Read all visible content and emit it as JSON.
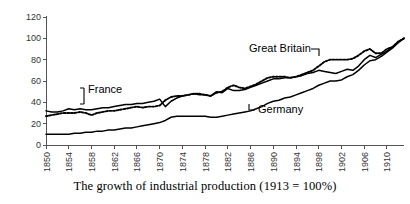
{
  "caption": "The growth of industrial production (1913 = 100%)",
  "annotations": [
    {
      "id": "france",
      "label": "France"
    },
    {
      "id": "britain",
      "label": "Great Britain"
    },
    {
      "id": "germany",
      "label": "Germany"
    }
  ],
  "chart_data": {
    "type": "line",
    "title": "The growth of industrial production (1913 = 100%)",
    "xlabel": "",
    "ylabel": "",
    "xlim": [
      1850,
      1913
    ],
    "ylim": [
      0,
      120
    ],
    "grid": false,
    "legend_position": "inline-annotations",
    "yticks": [
      0,
      20,
      40,
      60,
      80,
      100,
      120
    ],
    "xticks": [
      1850,
      1854,
      1858,
      1862,
      1866,
      1870,
      1874,
      1878,
      1882,
      1886,
      1890,
      1894,
      1898,
      1902,
      1906,
      1910
    ],
    "x": [
      1850,
      1851,
      1852,
      1853,
      1854,
      1855,
      1856,
      1857,
      1858,
      1859,
      1860,
      1861,
      1862,
      1863,
      1864,
      1865,
      1866,
      1867,
      1868,
      1869,
      1870,
      1871,
      1872,
      1873,
      1874,
      1875,
      1876,
      1877,
      1878,
      1879,
      1880,
      1881,
      1882,
      1883,
      1884,
      1885,
      1886,
      1887,
      1888,
      1889,
      1890,
      1891,
      1892,
      1893,
      1894,
      1895,
      1896,
      1897,
      1898,
      1899,
      1900,
      1901,
      1902,
      1903,
      1904,
      1905,
      1906,
      1907,
      1908,
      1909,
      1910,
      1911,
      1912,
      1913
    ],
    "series": [
      {
        "name": "France",
        "style": "solid",
        "values": [
          32,
          31,
          31,
          32,
          34,
          33,
          34,
          33,
          33,
          34,
          35,
          35,
          36,
          37,
          38,
          38,
          39,
          39,
          40,
          41,
          43,
          36,
          41,
          44,
          46,
          47,
          48,
          47,
          47,
          46,
          50,
          49,
          53,
          51,
          51,
          52,
          54,
          56,
          58,
          60,
          62,
          62,
          63,
          63,
          64,
          65,
          67,
          68,
          70,
          69,
          68,
          67,
          69,
          71,
          70,
          74,
          80,
          84,
          82,
          85,
          88,
          92,
          97,
          100
        ]
      },
      {
        "name": "Great Britain",
        "style": "dotted",
        "values": [
          27,
          28,
          29,
          30,
          30,
          30,
          31,
          30,
          28,
          30,
          31,
          32,
          32,
          33,
          34,
          35,
          36,
          35,
          36,
          36,
          37,
          42,
          45,
          46,
          46,
          47,
          48,
          48,
          47,
          46,
          49,
          50,
          54,
          56,
          54,
          53,
          55,
          57,
          60,
          63,
          64,
          64,
          64,
          63,
          64,
          66,
          68,
          70,
          74,
          78,
          80,
          80,
          80,
          80,
          81,
          84,
          88,
          90,
          86,
          86,
          90,
          92,
          97,
          100
        ]
      },
      {
        "name": "Germany",
        "style": "solid",
        "values": [
          10,
          10,
          10,
          10,
          10,
          11,
          11,
          12,
          12,
          13,
          13,
          14,
          14,
          15,
          16,
          16,
          17,
          18,
          19,
          20,
          21,
          23,
          26,
          27,
          27,
          27,
          27,
          27,
          27,
          26,
          26,
          27,
          28,
          29,
          30,
          31,
          32,
          34,
          36,
          39,
          41,
          42,
          44,
          45,
          47,
          49,
          51,
          53,
          56,
          58,
          60,
          60,
          61,
          64,
          66,
          70,
          75,
          79,
          80,
          83,
          87,
          91,
          96,
          100
        ]
      }
    ]
  }
}
